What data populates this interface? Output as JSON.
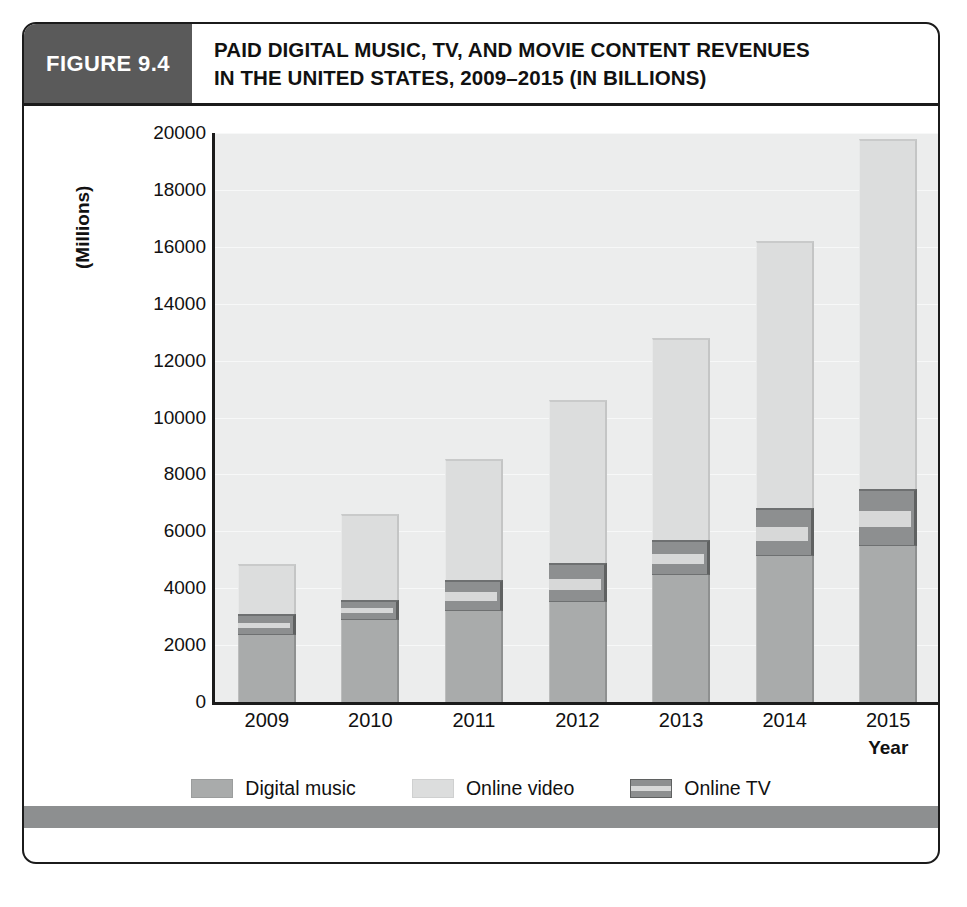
{
  "figure": {
    "number_label": "FIGURE 9.4",
    "title_line1": "PAID DIGITAL MUSIC, TV, AND MOVIE CONTENT REVENUES",
    "title_line2": "IN THE UNITED STATES, 2009–2015 (IN BILLIONS)"
  },
  "chart_data": {
    "type": "bar",
    "subtype": "stacked-vertical",
    "title": "PAID DIGITAL MUSIC, TV, AND MOVIE CONTENT REVENUES IN THE UNITED STATES, 2009–2015 (IN BILLIONS)",
    "xlabel": "Year",
    "ylabel": "(Millions)",
    "ylim": [
      0,
      20000
    ],
    "ytick_step": 2000,
    "yticks": [
      0,
      2000,
      4000,
      6000,
      8000,
      10000,
      12000,
      14000,
      16000,
      18000,
      20000
    ],
    "ytick_labels": [
      "0",
      "2000",
      "4000",
      "6000",
      "8000",
      "10000",
      "12000",
      "14000",
      "16000",
      "18000",
      "20000"
    ],
    "grid": true,
    "legend_position": "bottom",
    "categories": [
      "2009",
      "2010",
      "2011",
      "2012",
      "2013",
      "2014",
      "2015"
    ],
    "series": [
      {
        "name": "Digital music",
        "color": "#a9abab",
        "values": [
          2350,
          2900,
          3200,
          3500,
          4450,
          5130,
          5500
        ]
      },
      {
        "name": "Online TV",
        "color": "#8d8f90",
        "values": [
          750,
          700,
          1100,
          1400,
          1250,
          1700,
          2000
        ]
      },
      {
        "name": "Online video",
        "color": "#dcdddd",
        "values": [
          1750,
          3000,
          4250,
          5700,
          7100,
          9370,
          12300
        ]
      }
    ],
    "stack_order_bottom_to_top": [
      "Digital music",
      "Online TV",
      "Online video"
    ],
    "totals": [
      4850,
      6600,
      8550,
      10600,
      12800,
      16200,
      19800
    ]
  },
  "axes": {
    "y_title": "(Millions)",
    "x_title": "Year"
  },
  "legend": {
    "items": [
      {
        "label": "Digital music",
        "color": "#a9abab"
      },
      {
        "label": "Online  video",
        "color": "#dcdddd"
      },
      {
        "label": "Online TV",
        "color": "#8d8f90"
      }
    ]
  }
}
